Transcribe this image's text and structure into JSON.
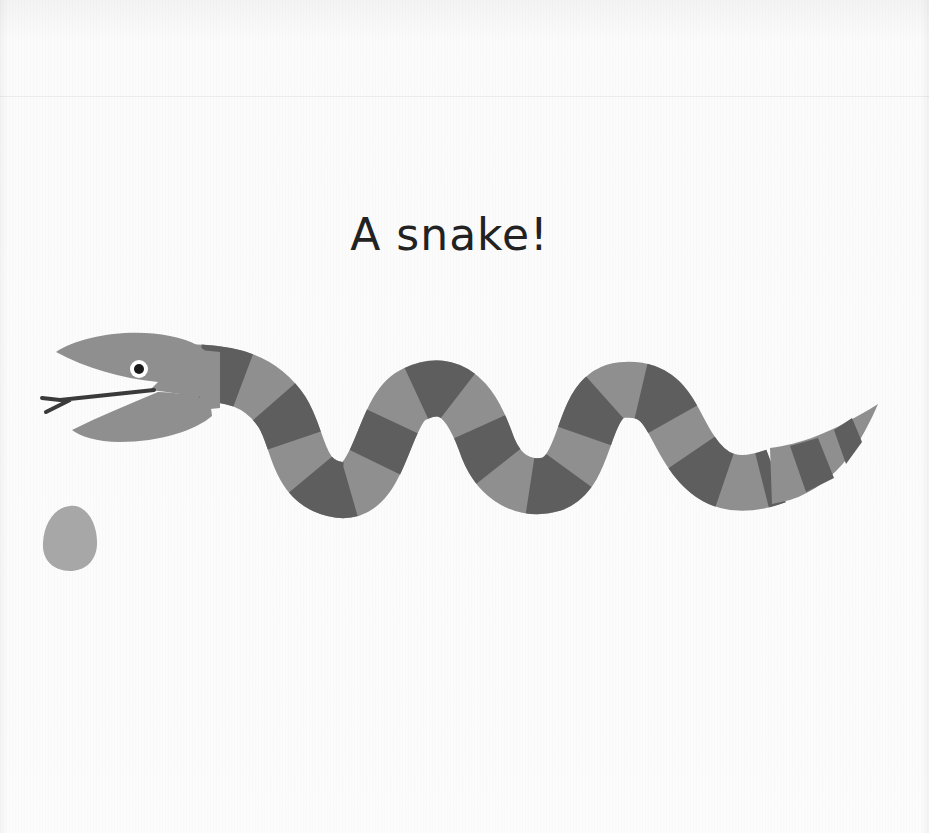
{
  "page": {
    "title": "A snake!"
  },
  "illustration": {
    "subject": "striped snake with open mouth and forked tongue",
    "elements": [
      {
        "name": "snake",
        "description": "long wavy striped snake"
      },
      {
        "name": "egg",
        "description": "small grey egg"
      }
    ],
    "colors": {
      "background": "#fbfbfb",
      "snake_light": "#8f8f8f",
      "snake_dark": "#5e5e5e",
      "head": "#8f8f8f",
      "tongue": "#3a3a3a",
      "eye_white": "#ffffff",
      "eye_pupil": "#1a1a1a",
      "egg": "#a7a7a7",
      "title_text": "#222222"
    }
  }
}
